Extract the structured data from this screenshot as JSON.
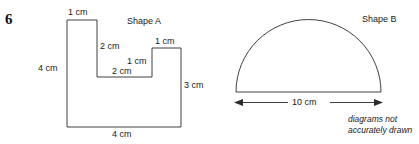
{
  "question": {
    "number": "6"
  },
  "shape_a": {
    "title": "Shape A",
    "labels": {
      "top_left": "1 cm",
      "inner_vertical": "2 cm",
      "inner_step_upper": "1 cm",
      "inner_step_lower": "2 cm",
      "step_top": "1 cm",
      "left_height": "4 cm",
      "right_height": "3 cm",
      "bottom_width": "4 cm"
    }
  },
  "shape_b": {
    "title": "Shape B",
    "labels": {
      "diameter": "10 cm"
    }
  },
  "footnote": {
    "line1": "diagrams not",
    "line2": "accurately drawn"
  },
  "colors": {
    "stroke": "#2b2b2b",
    "text": "#1a1a1a",
    "background": "#ffffff"
  }
}
